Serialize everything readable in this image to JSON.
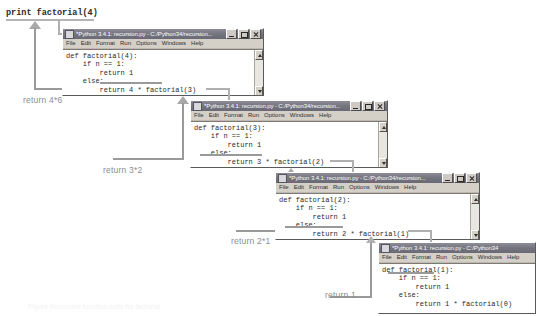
{
  "diagram": {
    "top_expression": "print factorial(4)",
    "accent_line_color": "#9a9a9a",
    "window_chrome_color": "#d4d0c8",
    "titlebar_color": "#74747f"
  },
  "return_labels": [
    {
      "id": "ret4",
      "text": "return 4*6"
    },
    {
      "id": "ret3",
      "text": "return 3*2"
    },
    {
      "id": "ret2",
      "text": "return 2*1"
    },
    {
      "id": "ret1",
      "text": "return 1"
    }
  ],
  "menu": {
    "items": [
      "File",
      "Edit",
      "Format",
      "Run",
      "Options",
      "Windows",
      "Help"
    ]
  },
  "window_buttons": {
    "minimize": "minimize",
    "maximize": "maximize",
    "close": "close"
  },
  "windows": [
    {
      "id": "win-factorial-4",
      "title": "*Python 3.4.1: recursion.py - C:/Python34/recursion...",
      "code": "def factorial(4):\n    if n == 1:\n        return 1\n    else:\n        return 4 * factorial(3)"
    },
    {
      "id": "win-factorial-3",
      "title": "*Python 3.4.1: recursion.py - C:/Python34/recursion...",
      "code": "def factorial(3):\n    if n == 1:\n        return 1\n    else:\n        return 3 * factorial(2)"
    },
    {
      "id": "win-factorial-2",
      "title": "*Python 3.4.1: recursion.py - C:/Python34/recursion...",
      "code": "def factorial(2):\n    if n == 1:\n        return 1\n    else:\n        return 2 * factorial(1)"
    },
    {
      "id": "win-factorial-1",
      "title": "*Python 3.4.1: recursion.py - C:/Python34",
      "code": "def factorial(1):\n    if n == 1:\n        return 1\n    else:\n        return 1 * factorial(0)"
    }
  ],
  "caption": {
    "text": "Figure  Recursive function calls for factorial"
  }
}
